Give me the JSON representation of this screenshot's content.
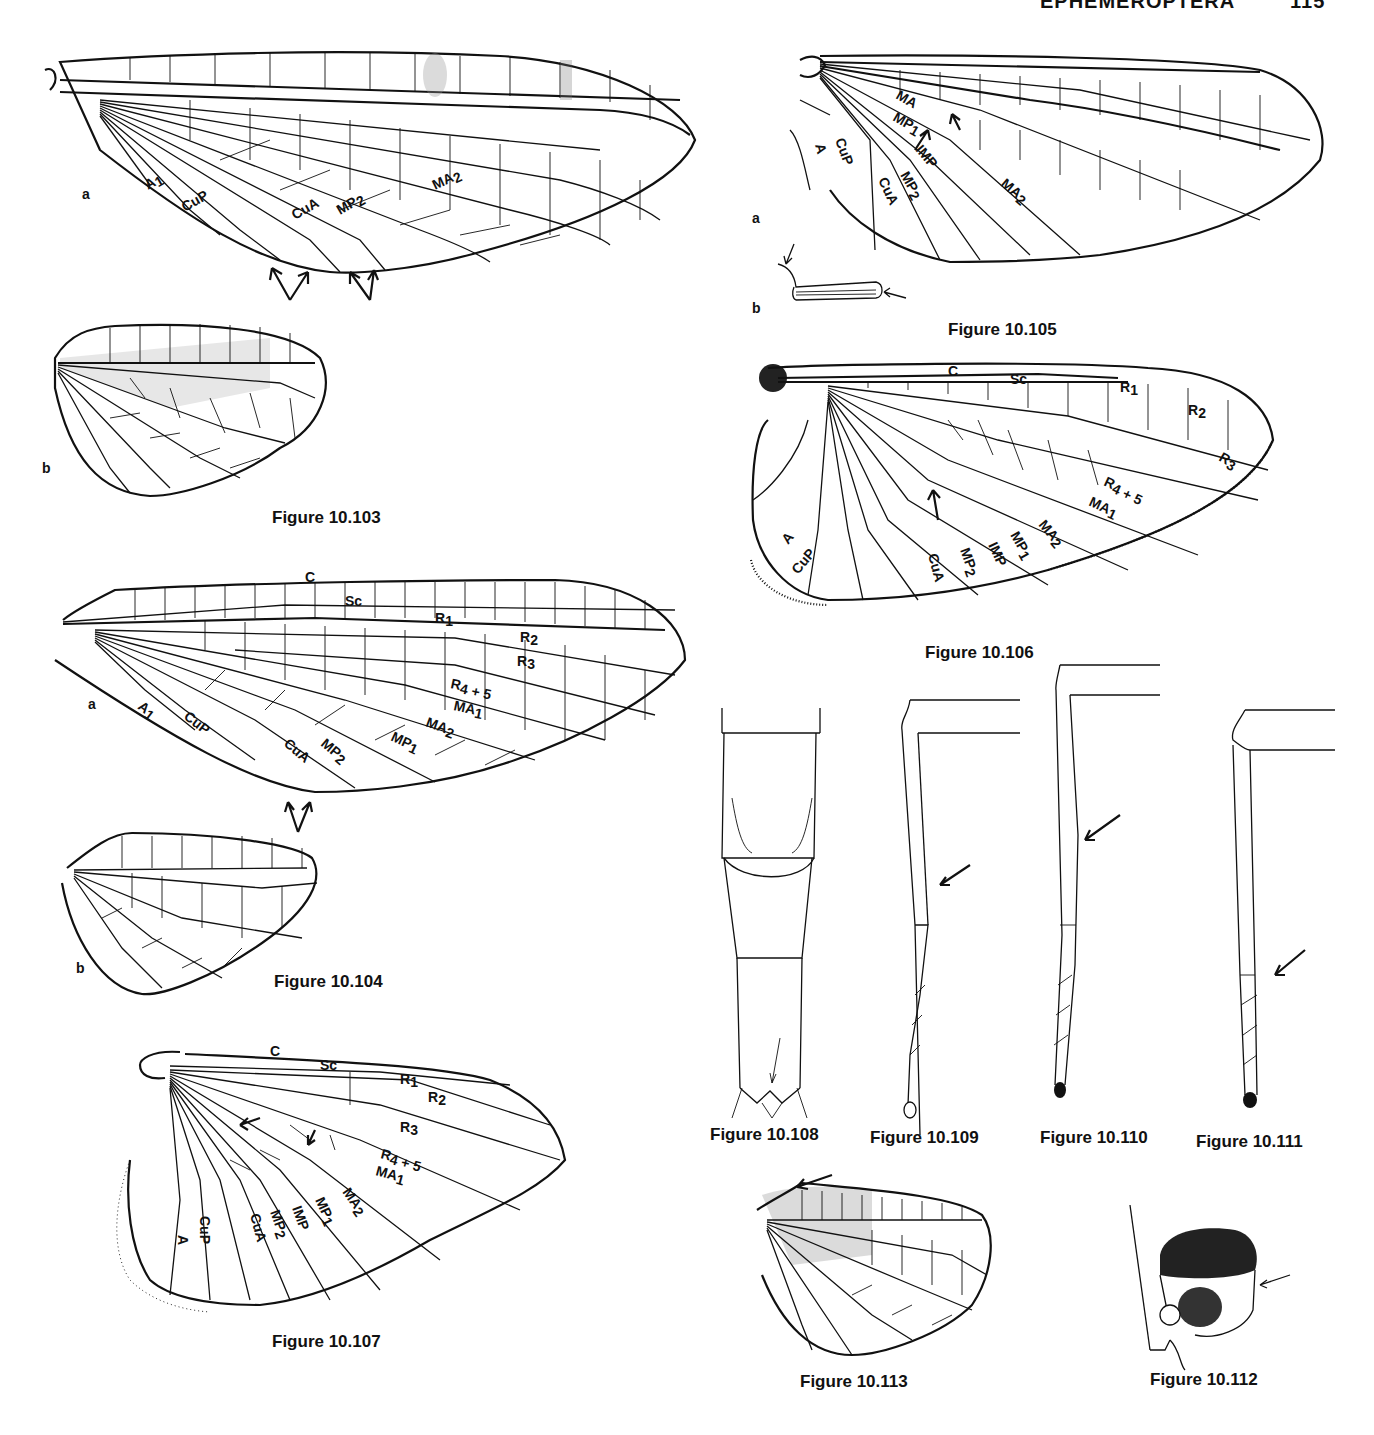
{
  "page": {
    "running_head": "EPHEMEROPTERA",
    "page_number": "115"
  },
  "figures": {
    "fig_103": {
      "caption": "Figure 10.103",
      "part_a": "a",
      "part_b": "b",
      "vein_labels": [
        "A1",
        "CuP",
        "CuA",
        "MP2",
        "MA2"
      ]
    },
    "fig_104": {
      "caption": "Figure 10.104",
      "part_a": "a",
      "part_b": "b",
      "vein_labels": [
        "C",
        "Sc",
        "R1",
        "R2",
        "R3",
        "R4+5",
        "MA1",
        "MA2",
        "MP1",
        "MP2",
        "CuA",
        "CuP",
        "A1"
      ]
    },
    "fig_105": {
      "caption": "Figure 10.105",
      "part_a": "a",
      "part_b": "b",
      "vein_labels": [
        "MA",
        "MP1",
        "IMP",
        "MP2",
        "CuA",
        "CuP",
        "A",
        "MA2"
      ]
    },
    "fig_106": {
      "caption": "Figure 10.106",
      "vein_labels": [
        "C",
        "Sc",
        "R1",
        "R2",
        "R3",
        "R4+5",
        "MA1",
        "MA2",
        "MP1",
        "IMP",
        "MP2",
        "CuA",
        "CuP",
        "A"
      ]
    },
    "fig_107": {
      "caption": "Figure 10.107",
      "vein_labels": [
        "C",
        "Sc",
        "R1",
        "R2",
        "R3",
        "R4+5",
        "MA1",
        "MA2",
        "MP1",
        "IMP",
        "MP2",
        "CuA",
        "CuP",
        "A"
      ]
    },
    "fig_108": {
      "caption": "Figure 10.108"
    },
    "fig_109": {
      "caption": "Figure 10.109"
    },
    "fig_110": {
      "caption": "Figure 10.110"
    },
    "fig_111": {
      "caption": "Figure 10.111"
    },
    "fig_112": {
      "caption": "Figure 10.112"
    },
    "fig_113": {
      "caption": "Figure 10.113"
    }
  },
  "labels": {
    "C": "C",
    "Sc": "Sc",
    "R1": "R",
    "R2": "R",
    "R3": "R",
    "R45": "R",
    "sub1": "1",
    "sub2": "2",
    "sub3": "3",
    "sub45": "4 + 5",
    "MA": "MA",
    "MP": "MP",
    "IMP": "IMP",
    "CuA": "CuA",
    "CuP": "CuP",
    "A": "A"
  }
}
